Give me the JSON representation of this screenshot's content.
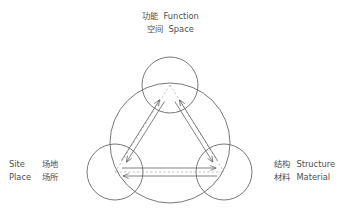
{
  "diagram": {
    "type": "venn-triad",
    "title_visible": false,
    "background_color": "#ffffff",
    "stroke_color": "#555555",
    "dashed_color": "#9a9a9a",
    "arrow_color": "#5a5a5a",
    "text_color": "#4f4f4f",
    "nodes": [
      {
        "id": "function-space",
        "position": "top",
        "cx": 170,
        "cy": 85,
        "r": 28,
        "label_cn_1": "功能",
        "label_en_1": "Function",
        "label_cn_2": "空间",
        "label_en_2": "Space"
      },
      {
        "id": "site-place",
        "position": "bottom-left",
        "cx": 115,
        "cy": 172,
        "r": 28,
        "label_en_1": "Site",
        "label_cn_1": "场地",
        "label_en_2": "Place",
        "label_cn_2": "场所"
      },
      {
        "id": "structure-material",
        "position": "bottom-right",
        "cx": 224,
        "cy": 172,
        "r": 28,
        "label_cn_1": "结构",
        "label_en_1": "Structure",
        "label_cn_2": "材料",
        "label_en_2": "Material"
      }
    ],
    "enclosing_circle": {
      "cx": 170,
      "cy": 143,
      "r": 60
    },
    "relations": [
      {
        "from": "site-place",
        "to": "function-space",
        "style": "double-arrow"
      },
      {
        "from": "structure-material",
        "to": "function-space",
        "style": "double-arrow"
      },
      {
        "from": "site-place",
        "to": "structure-material",
        "style": "double-arrow"
      }
    ],
    "triangle": {
      "style": "dashed",
      "connects": "node-centers"
    }
  },
  "labels": {
    "top": {
      "line1_cn": "功能",
      "line1_en": "Function",
      "line2_cn": "空间",
      "line2_en": "Space"
    },
    "left": {
      "line1_en": "Site",
      "line1_cn": "场地",
      "line2_en": "Place",
      "line2_cn": "场所"
    },
    "right": {
      "line1_cn": "结构",
      "line1_en": "Structure",
      "line2_cn": "材料",
      "line2_en": "Material"
    }
  }
}
